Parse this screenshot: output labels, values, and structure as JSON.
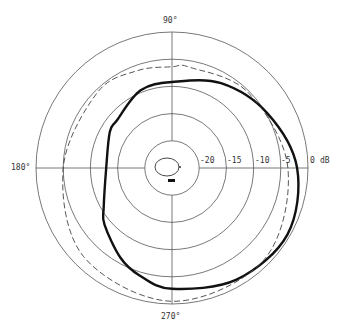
{
  "chart_data": {
    "type": "polar",
    "title": "",
    "angle_unit": "degrees",
    "radial_unit": "dB",
    "radial_range": [
      -25,
      0
    ],
    "radial_ticks": [
      -20,
      -15,
      -10,
      -5,
      0
    ],
    "radial_tick_labels": [
      "-20",
      "-15",
      "-10",
      "-5",
      "0"
    ],
    "radial_unit_label": "dB",
    "angle_labels": [
      {
        "angle": 90,
        "text": "90°"
      },
      {
        "angle": 180,
        "text": "180°"
      },
      {
        "angle": 270,
        "text": "270°"
      }
    ],
    "grid": true,
    "series": [
      {
        "name": "solid",
        "style": "solid-heavy",
        "color": "#111111",
        "angles": [
          0,
          30,
          60,
          90,
          112,
          139,
          150,
          180,
          210,
          220,
          240,
          253,
          270,
          300,
          330,
          360
        ],
        "values": [
          -2.0,
          -4.8,
          -7.0,
          -9.2,
          -9.6,
          -11.6,
          -11.8,
          -12.9,
          -10.5,
          -8.8,
          -6.0,
          -4.4,
          -2.8,
          -1.3,
          -0.5,
          -2.0
        ]
      },
      {
        "name": "dashed",
        "style": "dashed",
        "color": "#444444",
        "angles": [
          0,
          45,
          80,
          90,
          110,
          135,
          180,
          225,
          270,
          315,
          360
        ],
        "values": [
          -3.7,
          -5.3,
          -6.2,
          -6.4,
          -6.0,
          -5.5,
          -5.0,
          -2.0,
          -0.5,
          -1.1,
          -3.7
        ]
      },
      {
        "name": "inner",
        "style": "thin",
        "color": "#333333",
        "description": "small closed loop near origin (~-23 dB)"
      }
    ]
  },
  "labels": {
    "top": "90°",
    "left": "180°",
    "bottom": "270°",
    "r20": "-20",
    "r15": "-15",
    "r10": "-10",
    "r5": "-5",
    "r0": "0",
    "unit": "dB"
  }
}
